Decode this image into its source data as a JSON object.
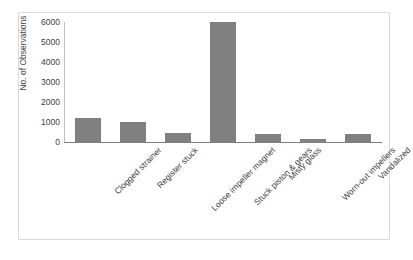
{
  "chart_data": {
    "type": "bar",
    "title": "",
    "subtitle": "",
    "xlabel": "",
    "ylabel": "No. of Observations",
    "ylim": [
      0,
      6000
    ],
    "ytick_labels": [
      "6000",
      "5000",
      "4000",
      "3000",
      "2000",
      "1000",
      "0"
    ],
    "yticks": [
      6000,
      5000,
      4000,
      3000,
      2000,
      1000,
      0
    ],
    "grid": false,
    "legend": false,
    "legend_position": "none",
    "bar_color": "#808080",
    "axis_color": "#7f7f7f",
    "border_color": "#d9d9d9",
    "categories": [
      "Clogged strainer",
      "Register stuck",
      "Loose impeller magnet",
      "Stuck piston & gears",
      "Misty glass",
      "Worn-out impellers",
      "Vandalized"
    ],
    "values": [
      1200,
      1000,
      450,
      6000,
      400,
      170,
      380
    ]
  }
}
